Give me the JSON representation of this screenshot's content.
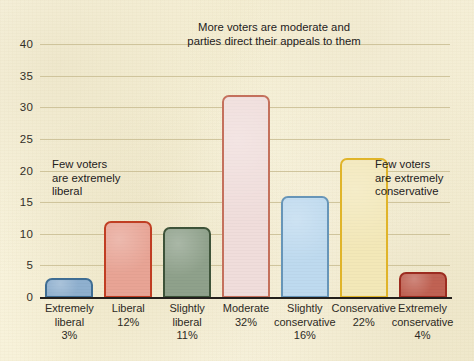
{
  "chart_data": {
    "type": "bar",
    "title": "More voters are moderate and\nparties direct their appeals to them",
    "xlabel": "",
    "ylabel": "",
    "ylim": [
      0,
      40
    ],
    "grid": true,
    "legend": "none",
    "categories": [
      "Extremely\nliberal",
      "Liberal",
      "Slightly\nliberal",
      "Moderate",
      "Slightly\nconservative",
      "Conservative",
      "Extremely\nconservative"
    ],
    "value_labels": [
      "3%",
      "12%",
      "11%",
      "32%",
      "16%",
      "22%",
      "4%"
    ],
    "values": [
      3,
      12,
      11,
      32,
      16,
      22,
      4
    ],
    "yticks": [
      0,
      5,
      10,
      15,
      20,
      25,
      30,
      35,
      40
    ],
    "ytick_labels": [
      "0",
      "5",
      "10",
      "15",
      "20",
      "25",
      "30",
      "35",
      "40"
    ],
    "annotations": [
      {
        "id": "top",
        "text": "More voters are moderate and\nparties direct their appeals to them"
      },
      {
        "id": "left",
        "text": "Few voters\nare extremely\nliberal"
      },
      {
        "id": "right",
        "text": "Few voters\nare extremely\nconservative"
      }
    ],
    "bar_colors": [
      {
        "fill": "#8fb0cf",
        "border": "#3f6d93"
      },
      {
        "fill": "#e8a495",
        "border": "#c03e23"
      },
      {
        "fill": "#8fa18b",
        "border": "#3d5339"
      },
      {
        "fill": "#f0dddb",
        "border": "#c4705c"
      },
      {
        "fill": "#bedaef",
        "border": "#6795b8"
      },
      {
        "fill": "#f3e8b8",
        "border": "#e0b429"
      },
      {
        "fill": "#c06253",
        "border": "#9c2c20"
      }
    ],
    "palette": {
      "paper": "#f8f3dc",
      "gridline": "#c9bd93",
      "axis": "#231f1c",
      "text": "#2b2a26"
    }
  }
}
